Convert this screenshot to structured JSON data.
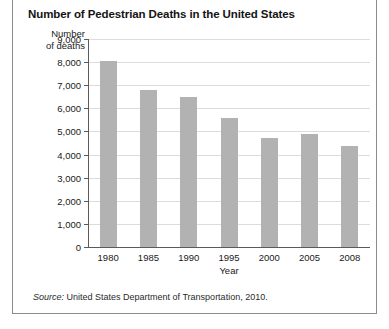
{
  "figure": {
    "title": "Number of Pedestrian Deaths in the United States",
    "y_axis_caption_line1": "Number",
    "y_axis_caption_line2": "of deaths",
    "x_axis_caption": "Year",
    "source_prefix": "Source:",
    "source_text": "United States Department of Transportation, 2010.",
    "bar_color": "#b2b2b2",
    "grid_color": "#dcdcdc",
    "axis_color": "#5a5a5a",
    "border_color": "#8c8c8c"
  },
  "chart_data": {
    "type": "bar",
    "title": "Number of Pedestrian Deaths in the United States",
    "xlabel": "Year",
    "ylabel": "Number of deaths",
    "categories": [
      "1980",
      "1985",
      "1990",
      "1995",
      "2000",
      "2005",
      "2008"
    ],
    "values": [
      8070,
      6800,
      6480,
      5580,
      4730,
      4880,
      4380
    ],
    "ylim": [
      0,
      9000
    ],
    "ytick_labels": [
      "9,000",
      "8,000",
      "7,000",
      "6,000",
      "5,000",
      "4,000",
      "3,000",
      "2,000",
      "1,000",
      "0"
    ],
    "ytick_values": [
      9000,
      8000,
      7000,
      6000,
      5000,
      4000,
      3000,
      2000,
      1000,
      0
    ],
    "grid": true,
    "legend": "none",
    "source": "Source: United States Department of Transportation, 2010."
  }
}
